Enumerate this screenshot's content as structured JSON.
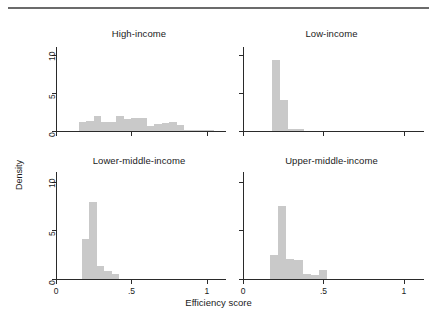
{
  "figure": {
    "xlabel": "Efficiency score",
    "ylabel": "Density",
    "y_ticks": [
      "0",
      "5",
      "10"
    ],
    "x_ticks": [
      "0",
      ".5",
      "1"
    ],
    "bar_color": "#c9c9c9",
    "axis_color": "#2a2a2a",
    "rule_color": "#6b6b6b"
  },
  "panels": [
    {
      "title": "High-income"
    },
    {
      "title": "Low-income"
    },
    {
      "title": "Lower-middle-income"
    },
    {
      "title": "Upper-middle-income"
    }
  ],
  "chart_data": {
    "type": "bar",
    "title": "",
    "subtitle": "",
    "xlabel": "Efficiency score",
    "ylabel": "Density",
    "xlim": [
      0,
      1.1
    ],
    "ylim": [
      0,
      11
    ],
    "x_ticks": [
      0,
      0.5,
      1
    ],
    "y_ticks": [
      0,
      5,
      10
    ],
    "grid": false,
    "legend": "none",
    "layout": "2x2 facet grid of histograms",
    "facets": [
      {
        "name": "High-income",
        "position": "top-left",
        "bin_width": 0.05,
        "bin_starts": [
          0.15,
          0.2,
          0.25,
          0.3,
          0.35,
          0.4,
          0.45,
          0.5,
          0.55,
          0.6,
          0.65,
          0.7,
          0.75,
          0.8,
          0.85,
          0.9,
          0.95,
          1.0
        ],
        "values": [
          1.2,
          1.3,
          1.9,
          1.2,
          1.2,
          2.0,
          1.6,
          1.7,
          1.7,
          0.6,
          0.9,
          1.0,
          1.2,
          0.8,
          0.15,
          0.1,
          0.1,
          0.1
        ]
      },
      {
        "name": "Low-income",
        "position": "top-right",
        "bin_width": 0.05,
        "bin_starts": [
          0.18,
          0.23,
          0.28,
          0.33
        ],
        "values": [
          9.3,
          4.0,
          0.3,
          0.25
        ]
      },
      {
        "name": "Lower-middle-income",
        "position": "bottom-left",
        "bin_width": 0.05,
        "bin_starts": [
          0.17,
          0.22,
          0.27,
          0.32,
          0.37
        ],
        "values": [
          4.1,
          7.9,
          1.3,
          0.8,
          0.5
        ]
      },
      {
        "name": "Upper-middle-income",
        "position": "bottom-right",
        "bin_width": 0.05,
        "bin_starts": [
          0.17,
          0.22,
          0.27,
          0.32,
          0.37,
          0.42,
          0.47
        ],
        "values": [
          2.5,
          7.5,
          2.1,
          2.0,
          0.5,
          0.4,
          0.9
        ]
      }
    ]
  }
}
